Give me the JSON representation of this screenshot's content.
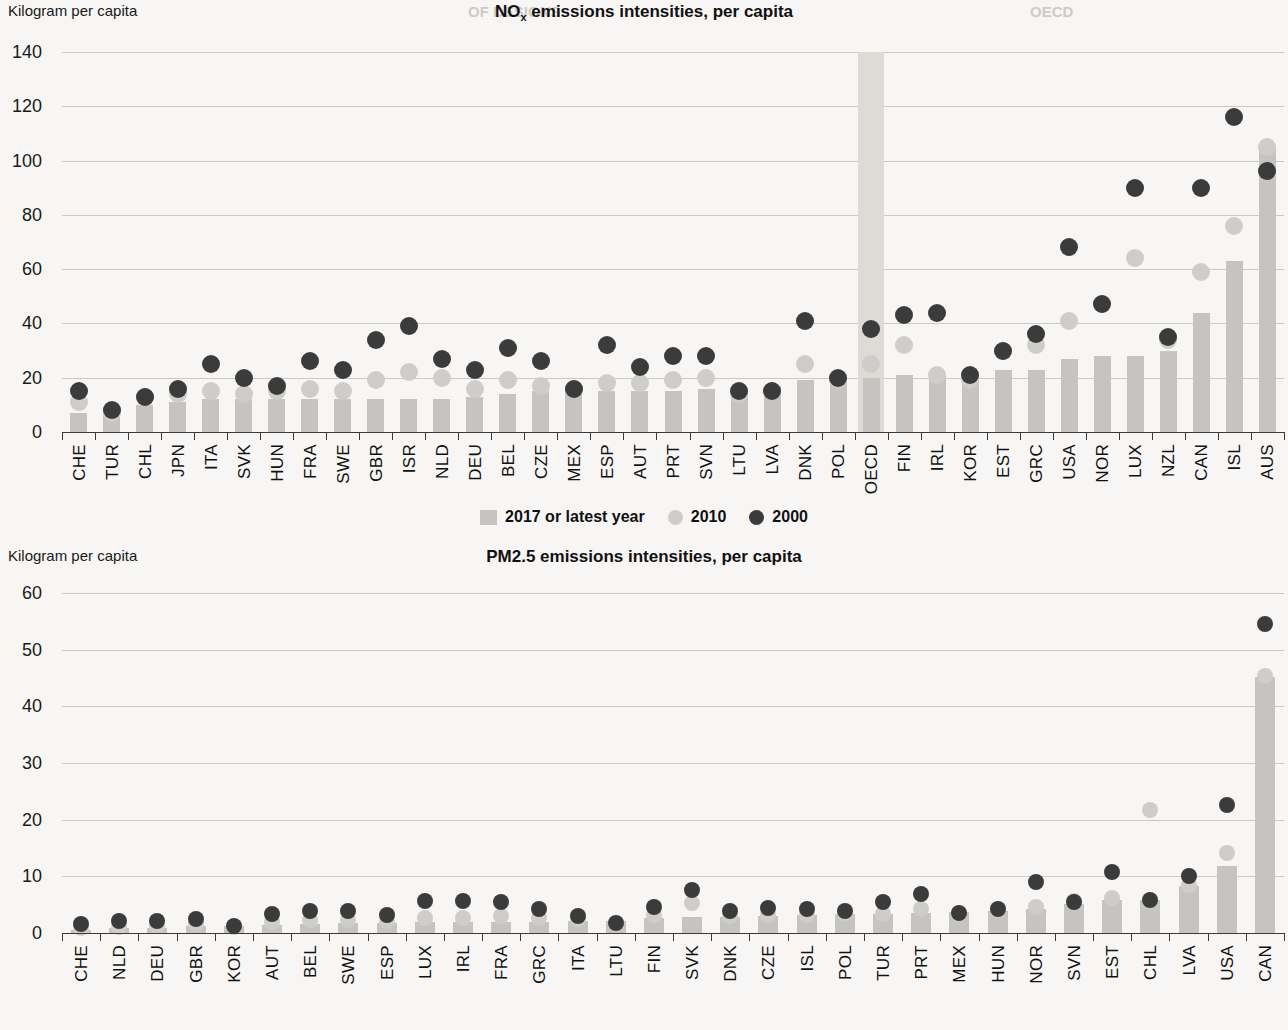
{
  "page": {
    "unit_label": "Kilogram per capita",
    "faint_header_left": "OECD",
    "faint_header_center": "OF DESIGNS"
  },
  "legend": {
    "bar_label": "2017 or latest year",
    "dot2010_label": "2010",
    "dot2000_label": "2000",
    "bar_color": "#c6c4c0",
    "dot2010_color": "#cfcdc9",
    "dot2000_color": "#3b3b3b"
  },
  "chart_data": [
    {
      "type": "bar",
      "id": "nox",
      "title": "NOx emissions intensities, per capita",
      "title_html_parts": {
        "main": "NO",
        "sub": "x",
        "rest": " emissions intensities, per capita"
      },
      "ylabel": "Kilogram per capita",
      "xlabel": "",
      "ylim": [
        0,
        140
      ],
      "yticks": [
        0,
        20,
        40,
        60,
        80,
        100,
        120,
        140
      ],
      "grid": true,
      "legend_position": "bottom",
      "highlight_category": "OECD",
      "categories": [
        "CHE",
        "TUR",
        "CHL",
        "JPN",
        "ITA",
        "SVK",
        "HUN",
        "FRA",
        "SWE",
        "GBR",
        "ISR",
        "NLD",
        "DEU",
        "BEL",
        "CZE",
        "MEX",
        "ESP",
        "AUT",
        "PRT",
        "SVN",
        "LTU",
        "LVA",
        "DNK",
        "POL",
        "OECD",
        "FIN",
        "IRL",
        "KOR",
        "EST",
        "GRC",
        "USA",
        "NOR",
        "LUX",
        "NZL",
        "CAN",
        "ISL",
        "AUS"
      ],
      "series": [
        {
          "name": "2017 or latest year",
          "kind": "bar",
          "values": [
            7,
            9,
            10,
            11,
            12,
            12,
            12,
            12,
            12,
            12,
            12,
            12,
            13,
            14,
            15,
            15,
            15,
            15,
            15,
            16,
            15,
            17,
            19,
            20,
            20,
            21,
            21,
            21,
            23,
            23,
            27,
            28,
            28,
            30,
            44,
            63,
            105
          ]
        },
        {
          "name": "2010",
          "kind": "dot",
          "values": [
            11,
            7,
            13,
            14,
            15,
            14,
            15,
            16,
            15,
            19,
            22,
            20,
            16,
            19,
            17,
            16,
            18,
            18,
            19,
            20,
            14,
            15,
            25,
            19,
            25,
            32,
            21,
            19,
            30,
            32,
            41,
            47,
            64,
            34,
            59,
            76,
            105
          ]
        },
        {
          "name": "2000",
          "kind": "dot",
          "values": [
            15,
            8,
            13,
            16,
            25,
            20,
            17,
            26,
            23,
            34,
            39,
            27,
            23,
            31,
            26,
            16,
            32,
            24,
            28,
            28,
            15,
            15,
            41,
            20,
            38,
            43,
            44,
            21,
            30,
            36,
            68,
            47,
            90,
            35,
            90,
            116,
            96
          ]
        }
      ]
    },
    {
      "type": "bar",
      "id": "pm25",
      "title": "PM2.5 emissions intensities, per capita",
      "ylabel": "Kilogram per capita",
      "xlabel": "",
      "ylim": [
        0,
        60
      ],
      "yticks": [
        0,
        10,
        20,
        30,
        40,
        50,
        60
      ],
      "grid": true,
      "legend_position": "none",
      "highlight_category": "",
      "categories": [
        "CHE",
        "NLD",
        "DEU",
        "GBR",
        "KOR",
        "AUT",
        "BEL",
        "SWE",
        "ESP",
        "LUX",
        "IRL",
        "FRA",
        "GRC",
        "ITA",
        "LTU",
        "FIN",
        "SVK",
        "DNK",
        "CZE",
        "ISL",
        "POL",
        "TUR",
        "PRT",
        "MEX",
        "HUN",
        "NOR",
        "SVN",
        "EST",
        "CHL",
        "LVA",
        "USA",
        "CAN"
      ],
      "series": [
        {
          "name": "2017 or latest year",
          "kind": "bar",
          "values": [
            0.6,
            0.8,
            0.9,
            1.2,
            1.3,
            1.5,
            1.6,
            1.7,
            1.7,
            1.9,
            1.9,
            1.9,
            2.0,
            2.1,
            2.1,
            2.6,
            2.8,
            2.9,
            3.0,
            3.2,
            3.3,
            3.4,
            3.6,
            3.7,
            3.8,
            4.2,
            5.2,
            5.9,
            5.9,
            8.3,
            11.8,
            45.2
          ]
        },
        {
          "name": "2010",
          "kind": "dot",
          "values": [
            0.9,
            1.1,
            1.3,
            1.6,
            1.1,
            2.0,
            2.3,
            2.3,
            2.1,
            2.6,
            2.7,
            3.0,
            2.6,
            2.4,
            1.6,
            3.1,
            5.3,
            3.0,
            3.2,
            3.2,
            3.5,
            3.4,
            4.3,
            3.3,
            4.0,
            4.6,
            5.6,
            6.2,
            21.7,
            8.5,
            14.2,
            45.4
          ]
        },
        {
          "name": "2000",
          "kind": "dot",
          "values": [
            1.6,
            2.2,
            2.1,
            2.5,
            1.2,
            3.4,
            3.8,
            3.8,
            3.2,
            5.7,
            5.6,
            5.5,
            4.2,
            3.0,
            1.7,
            4.6,
            7.6,
            3.9,
            4.5,
            4.2,
            3.9,
            5.5,
            6.9,
            3.6,
            4.2,
            9.0,
            5.5,
            10.7,
            5.9,
            10.0,
            22.6,
            54.5
          ]
        }
      ]
    }
  ]
}
